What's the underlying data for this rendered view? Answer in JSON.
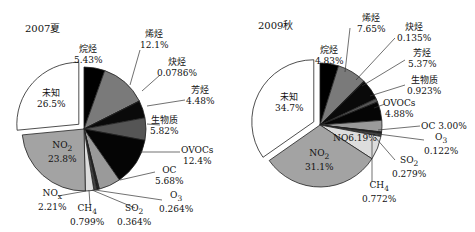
{
  "chart_data": [
    {
      "type": "pie",
      "title": "2007夏",
      "slices": [
        {
          "label": "烷烃",
          "value": 5.43,
          "display": "5.43%",
          "color": "#000000"
        },
        {
          "label": "烯烃",
          "value": 12.1,
          "display": "12.1%",
          "color": "#7a7a7a"
        },
        {
          "label": "炔烃",
          "value": 0.0786,
          "display": "0.0786%",
          "color": "#333333"
        },
        {
          "label": "芳烃",
          "value": 4.48,
          "display": "4.48%",
          "color": "#0a0a0a"
        },
        {
          "label": "生物质",
          "value": 5.82,
          "display": "5.82%",
          "color": "#555555"
        },
        {
          "label": "OVOCs",
          "value": 12.4,
          "display": "12.4%",
          "color": "#050505"
        },
        {
          "label": "OC",
          "value": 5.68,
          "display": "5.68%",
          "color": "#9a9a9a"
        },
        {
          "label": "O3",
          "value": 0.264,
          "display": "0.264%",
          "color": "#222222"
        },
        {
          "label": "SO2",
          "value": 0.364,
          "display": "0.364%",
          "color": "#111111"
        },
        {
          "label": "CH4",
          "value": 0.799,
          "display": "0.799%",
          "color": "#444444"
        },
        {
          "label": "NOx",
          "value": 2.21,
          "display": "2.21%",
          "color": "#dddddd"
        },
        {
          "label": "NO2",
          "value": 23.8,
          "display": "23.8%",
          "color": "#a3a3a3"
        },
        {
          "label": "未知",
          "value": 26.5,
          "display": "26.5%",
          "color": "#ffffff",
          "exploded": true
        }
      ]
    },
    {
      "type": "pie",
      "title": "2009秋",
      "slices": [
        {
          "label": "烷烃",
          "value": 4.83,
          "display": "4.83%",
          "color": "#000000"
        },
        {
          "label": "烯烃",
          "value": 7.65,
          "display": "7.65%",
          "color": "#7a7a7a"
        },
        {
          "label": "炔烃",
          "value": 0.135,
          "display": "0.135%",
          "color": "#333333"
        },
        {
          "label": "芳烃",
          "value": 5.37,
          "display": "5.37%",
          "color": "#0a0a0a"
        },
        {
          "label": "生物质",
          "value": 0.923,
          "display": "0.923%",
          "color": "#555555"
        },
        {
          "label": "OVOCs",
          "value": 4.88,
          "display": "4.88%",
          "color": "#050505"
        },
        {
          "label": "OC",
          "value": 3.0,
          "display": "3.00%",
          "color": "#9a9a9a"
        },
        {
          "label": "O3",
          "value": 0.122,
          "display": "0.122%",
          "color": "#222222"
        },
        {
          "label": "SO2",
          "value": 0.279,
          "display": "0.279%",
          "color": "#111111"
        },
        {
          "label": "CH4",
          "value": 0.772,
          "display": "0.772%",
          "color": "#444444"
        },
        {
          "label": "NO",
          "value": 6.19,
          "display": "6.19%",
          "color": "#dddddd"
        },
        {
          "label": "NO2",
          "value": 31.1,
          "display": "31.1%",
          "color": "#a3a3a3"
        },
        {
          "label": "未知",
          "value": 34.7,
          "display": "34.7%",
          "color": "#ffffff",
          "exploded": true
        }
      ]
    }
  ],
  "left": {
    "title": "2007夏",
    "labels": {
      "alkane": {
        "name": "烷烃",
        "pct": "5.43%"
      },
      "alkene": {
        "name": "烯烃",
        "pct": "12.1%"
      },
      "alkyne": {
        "name": "炔烃",
        "pct": "0.0786%"
      },
      "aromatic": {
        "name": "芳烃",
        "pct": "4.48%"
      },
      "biomass": {
        "name": "生物质",
        "pct": "5.82%"
      },
      "ovocs": {
        "name": "OVOCs",
        "pct": "12.4%"
      },
      "oc": {
        "name": "OC",
        "pct": "5.68%"
      },
      "o3": {
        "name": "O",
        "sub": "3",
        "pct": "0.264%"
      },
      "so2": {
        "name": "SO",
        "sub": "2",
        "pct": "0.364%"
      },
      "ch4": {
        "name": "CH",
        "sub": "4",
        "pct": "0.799%"
      },
      "nox": {
        "name": "NO",
        "sub": "x",
        "pct": "2.21%"
      },
      "no2": {
        "name": "NO",
        "sub": "2",
        "pct": "23.8%"
      },
      "unknown": {
        "name": "未知",
        "pct": "26.5%"
      }
    }
  },
  "right": {
    "title": "2009秋",
    "labels": {
      "alkane": {
        "name": "烷烃",
        "pct": "4.83%"
      },
      "alkene": {
        "name": "烯烃",
        "pct": "7.65%"
      },
      "alkyne": {
        "name": "炔烃",
        "pct": "0.135%"
      },
      "aromatic": {
        "name": "芳烃",
        "pct": "5.37%"
      },
      "biomass": {
        "name": "生物质",
        "pct": "0.923%"
      },
      "ovocs": {
        "name": "OVOCs",
        "pct": "4.88%"
      },
      "oc": {
        "name": "OC",
        "pct": "3.00%"
      },
      "o3": {
        "name": "O",
        "sub": "3",
        "pct": "0.122%"
      },
      "so2": {
        "name": "SO",
        "sub": "2",
        "pct": "0.279%"
      },
      "ch4": {
        "name": "CH",
        "sub": "4",
        "pct": "0.772%"
      },
      "no": {
        "name": "NO",
        "pct": "6.19%"
      },
      "no2": {
        "name": "NO",
        "sub": "2",
        "pct": "31.1%"
      },
      "unknown": {
        "name": "未知",
        "pct": "34.7%"
      }
    }
  }
}
